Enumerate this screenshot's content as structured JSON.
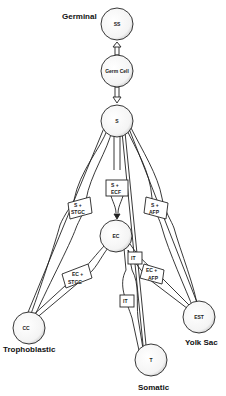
{
  "nodes": {
    "ss": {
      "label": "SS"
    },
    "germ_cell": {
      "label": "Germ Cell"
    },
    "s": {
      "label": "S"
    },
    "ec": {
      "label": "EC"
    },
    "cc": {
      "label": "CC"
    },
    "t": {
      "label": "T"
    },
    "est": {
      "label": "EST"
    }
  },
  "region_labels": {
    "germinal": "Germinal",
    "trophoblastic": "Trophoblastic",
    "somatic": "Somatic",
    "yolk_sac": "Yolk Sac"
  },
  "transitions": {
    "s_stgc_1": "S +",
    "s_stgc_2": "STGC",
    "s_ecf_1": "S +",
    "s_ecf_2": "ECF",
    "s_afp_1": "S +",
    "s_afp_2": "AFP",
    "ec_stgc_1": "EC +",
    "ec_stgc_2": "STGC",
    "ec_afp_1": "EC +",
    "ec_afp_2": "AFP",
    "it_upper": "IT",
    "it_lower": "IT"
  }
}
